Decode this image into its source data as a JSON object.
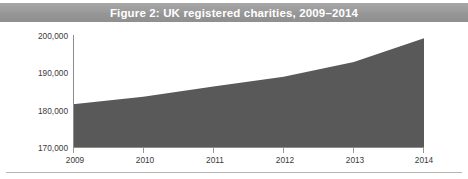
{
  "banner": {
    "title": "Figure 2: UK registered charities, 2009–2014",
    "background_color": "#999999",
    "text_color": "#ffffff"
  },
  "chart_data": {
    "type": "area",
    "title": "Figure 2: UK registered charities, 2009–2014",
    "xlabel": "",
    "ylabel": "",
    "categories": [
      "2009",
      "2010",
      "2011",
      "2012",
      "2013",
      "2014"
    ],
    "x": [
      2009,
      2010,
      2011,
      2012,
      2013,
      2014
    ],
    "values": [
      181500,
      183500,
      186200,
      188800,
      192700,
      199000
    ],
    "series": [
      {
        "name": "UK registered charities",
        "values": [
          181500,
          183500,
          186200,
          188800,
          192700,
          199000
        ]
      }
    ],
    "ylim": [
      170000,
      200000
    ],
    "xlim": [
      2009,
      2014
    ],
    "yticks": [
      170000,
      180000,
      190000,
      200000
    ],
    "ytick_labels": [
      "170,000",
      "180,000",
      "190,000",
      "200,000"
    ],
    "xticks": [
      2009,
      2010,
      2011,
      2012,
      2013,
      2014
    ],
    "xtick_labels": [
      "2009",
      "2010",
      "2011",
      "2012",
      "2013",
      "2014"
    ],
    "grid": false,
    "legend": false,
    "legend_position": "none",
    "fill_color": "#595959",
    "axis_color": "#8c8c8c",
    "background_color": "#ffffff"
  },
  "axes": {
    "y_labels": [
      "200,000",
      "190,000",
      "180,000",
      "170,000"
    ],
    "x_labels": [
      "2009",
      "2010",
      "2011",
      "2012",
      "2013",
      "2014"
    ]
  }
}
